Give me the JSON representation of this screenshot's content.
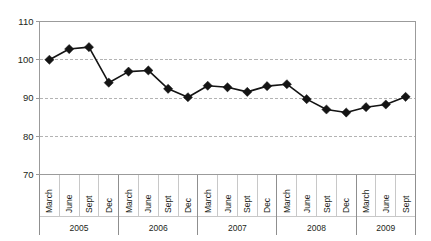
{
  "chart_data": {
    "type": "line",
    "title": "",
    "subtitle": "",
    "xlabel": "",
    "ylabel": "",
    "ylim": [
      70,
      110
    ],
    "yticks": [
      70,
      80,
      90,
      100,
      110
    ],
    "ytick_labels": [
      "70",
      "80",
      "90",
      "100",
      "110"
    ],
    "grid": true,
    "legend": "none",
    "marker": "diamond",
    "line_color": "#141414",
    "marker_color": "#141414",
    "gridline_color": "#b3b3b3",
    "axis_color": "#9b9b9b",
    "categories": [
      "March",
      "June",
      "Sept",
      "Dec",
      "March",
      "June",
      "Sept",
      "Dec",
      "March",
      "June",
      "Sept",
      "Dec",
      "March",
      "June",
      "Sept",
      "Dec",
      "March",
      "June",
      "Sept"
    ],
    "values": [
      100.0,
      102.8,
      103.3,
      94.0,
      96.9,
      97.2,
      92.4,
      90.2,
      93.2,
      92.8,
      91.6,
      93.1,
      93.6,
      89.7,
      87.0,
      86.2,
      87.6,
      88.3,
      90.3
    ],
    "year_groups": [
      {
        "label": "2005",
        "count": 4
      },
      {
        "label": "2006",
        "count": 4
      },
      {
        "label": "2007",
        "count": 4
      },
      {
        "label": "2008",
        "count": 4
      },
      {
        "label": "2009",
        "count": 3
      }
    ],
    "series": [
      {
        "name": "index",
        "values": [
          100.0,
          102.8,
          103.3,
          94.0,
          96.9,
          97.2,
          92.4,
          90.2,
          93.2,
          92.8,
          91.6,
          93.1,
          93.6,
          89.7,
          87.0,
          86.2,
          87.6,
          88.3,
          90.3
        ]
      }
    ]
  }
}
